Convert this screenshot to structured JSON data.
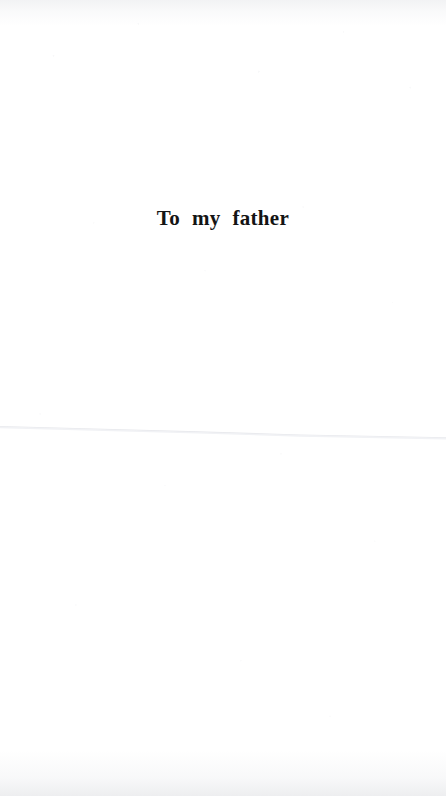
{
  "page": {
    "kind": "book-dedication-page",
    "width": 446,
    "height": 796,
    "background_color": "#ffffff",
    "ink_color": "#141414"
  },
  "dedication": {
    "text": "To my father"
  },
  "artifacts": {
    "fold_line_color": "#e9eaee",
    "edge_shadow_color": "#a8acb6"
  }
}
